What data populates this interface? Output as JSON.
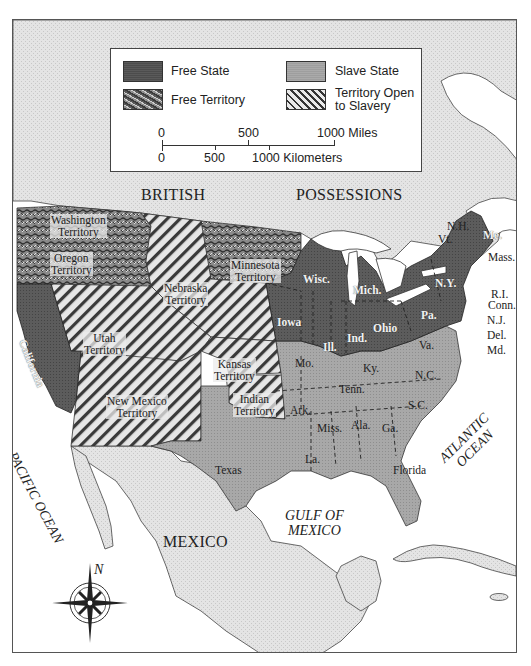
{
  "legend": {
    "items": [
      {
        "label": "Free State",
        "pattern": "dark-solid",
        "color": "#5a5a5a"
      },
      {
        "label": "Slave State",
        "pattern": "light-solid",
        "color": "#a9a9a9"
      },
      {
        "label": "Free Territory",
        "pattern": "dark-squiggle",
        "color": "#7a7a7a"
      },
      {
        "label": "Territory Open to Slavery",
        "line1": "Territory Open",
        "line2": "to Slavery",
        "pattern": "diagonal-hatch",
        "color": "#d8d8d8"
      }
    ],
    "scale": {
      "miles_ticks": [
        "0",
        "500",
        "1000 Miles"
      ],
      "km_ticks": [
        "0",
        "500",
        "1000 Kilometers"
      ]
    }
  },
  "regions": {
    "british": "BRITISH",
    "possessions": "POSSESSIONS",
    "mexico": "MEXICO"
  },
  "water": {
    "pacific": "PACIFIC OCEAN",
    "atlantic_line1": "ATLANTIC",
    "atlantic_line2": "OCEAN",
    "gulf_line1": "GULF OF",
    "gulf_line2": "MEXICO"
  },
  "free_territories": [
    {
      "line1": "Washington",
      "line2": "Territory"
    },
    {
      "line1": "Oregon",
      "line2": "Territory"
    },
    {
      "line1": "Minnesota",
      "line2": "Territory"
    }
  ],
  "open_territories": [
    {
      "line1": "Nebraska",
      "line2": "Territory"
    },
    {
      "line1": "Utah",
      "line2": "Territory"
    },
    {
      "line1": "Kansas",
      "line2": "Territory"
    },
    {
      "line1": "Indian",
      "line2": "Territory"
    },
    {
      "line1": "New Mexico",
      "line2": "Territory"
    }
  ],
  "free_states": {
    "california": "California",
    "iowa": "Iowa",
    "wisc": "Wisc.",
    "mich": "Mich.",
    "ill": "Ill.",
    "ind": "Ind.",
    "ohio": "Ohio",
    "pa": "Pa.",
    "ny": "N.Y.",
    "me": "Me.",
    "nh": "N.H.",
    "vt": "Vt.",
    "mass": "Mass.",
    "ri": "R.I.",
    "conn": "Conn.",
    "nj": "N.J."
  },
  "slave_states": {
    "mo": "Mo.",
    "ky": "Ky.",
    "va": "Va.",
    "del": "Del.",
    "md": "Md.",
    "nc": "N.C.",
    "tenn": "Tenn.",
    "sc": "S.C.",
    "ark": "Ark.",
    "miss": "Miss.",
    "ala": "Ala.",
    "ga": "Ga.",
    "la": "La.",
    "texas": "Texas",
    "florida": "Florida"
  },
  "compass": {
    "north_label": "N"
  }
}
